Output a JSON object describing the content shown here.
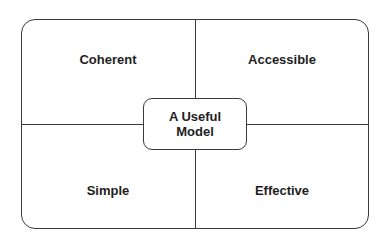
{
  "diagram": {
    "type": "quadrant",
    "center": {
      "line1": "A Useful",
      "line2": "Model"
    },
    "quadrants": {
      "top_left": "Coherent",
      "top_right": "Accessible",
      "bottom_left": "Simple",
      "bottom_right": "Effective"
    },
    "colors": {
      "stroke": "#3a3a3a",
      "text": "#1e1e1e",
      "background": "#ffffff"
    }
  }
}
